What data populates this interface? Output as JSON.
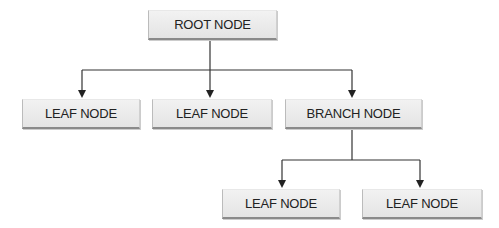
{
  "diagram": {
    "type": "tree",
    "nodes": [
      {
        "id": "root",
        "label": "ROOT NODE"
      },
      {
        "id": "leaf1",
        "label": "LEAF NODE"
      },
      {
        "id": "leaf2",
        "label": "LEAF NODE"
      },
      {
        "id": "branch",
        "label": "BRANCH NODE"
      },
      {
        "id": "leaf3",
        "label": "LEAF NODE"
      },
      {
        "id": "leaf4",
        "label": "LEAF NODE"
      }
    ],
    "edges": [
      {
        "from": "root",
        "to": "leaf1"
      },
      {
        "from": "root",
        "to": "leaf2"
      },
      {
        "from": "root",
        "to": "branch"
      },
      {
        "from": "branch",
        "to": "leaf3"
      },
      {
        "from": "branch",
        "to": "leaf4"
      }
    ],
    "colors": {
      "line": "#333333",
      "box_fill": "#ebebeb",
      "box_shadow": "#8a8a8a",
      "text": "#222222"
    }
  }
}
